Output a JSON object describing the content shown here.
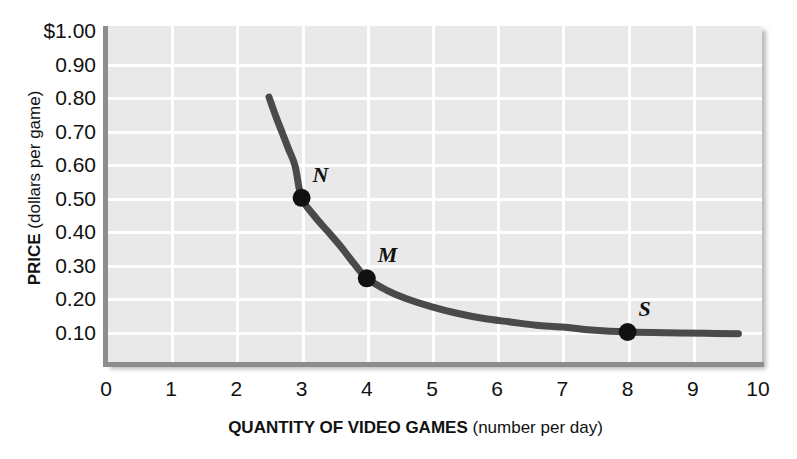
{
  "chart_data": {
    "type": "line",
    "title": "",
    "xlabel_bold": "QUANTITY OF VIDEO GAMES",
    "xlabel_plain": "(number per day)",
    "ylabel_bold": "PRICE",
    "ylabel_plain": "(dollars per game)",
    "xlim": [
      0,
      10
    ],
    "ylim": [
      0,
      1.0
    ],
    "grid": true,
    "legend": "none",
    "xticks": [
      "0",
      "1",
      "2",
      "3",
      "4",
      "5",
      "6",
      "7",
      "8",
      "9",
      "10"
    ],
    "xtick_values": [
      0,
      1,
      2,
      3,
      4,
      5,
      6,
      7,
      8,
      9,
      10
    ],
    "yticks": [
      "$1.00",
      "0.90",
      "0.80",
      "0.70",
      "0.60",
      "0.50",
      "0.40",
      "0.30",
      "0.20",
      "0.10"
    ],
    "ytick_values": [
      1.0,
      0.9,
      0.8,
      0.7,
      0.6,
      0.5,
      0.4,
      0.3,
      0.2,
      0.1
    ],
    "series": [
      {
        "name": "demand-curve",
        "color": "#4a4a4a",
        "x": [
          2.5,
          2.6,
          2.7,
          2.8,
          2.9,
          3.0,
          3.2,
          3.4,
          3.6,
          3.8,
          4.0,
          4.3,
          4.6,
          5.0,
          5.4,
          5.8,
          6.2,
          6.6,
          7.0,
          7.5,
          8.0,
          8.6,
          9.2,
          9.7
        ],
        "y": [
          0.8,
          0.745,
          0.695,
          0.645,
          0.595,
          0.5,
          0.445,
          0.4,
          0.355,
          0.305,
          0.26,
          0.225,
          0.2,
          0.175,
          0.155,
          0.14,
          0.13,
          0.12,
          0.115,
          0.105,
          0.1,
          0.098,
          0.096,
          0.095
        ]
      }
    ],
    "points": [
      {
        "label": "N",
        "x": 3.0,
        "y": 0.5
      },
      {
        "label": "M",
        "x": 4.0,
        "y": 0.26
      },
      {
        "label": "S",
        "x": 8.0,
        "y": 0.1
      }
    ],
    "colors": {
      "plot_background": "#e9e9e9",
      "gridline": "#ffffff",
      "axis": "#8d8d8d",
      "curve": "#4a4a4a",
      "marker": "#111111",
      "text": "#111111",
      "page_background": "#ffffff"
    }
  }
}
